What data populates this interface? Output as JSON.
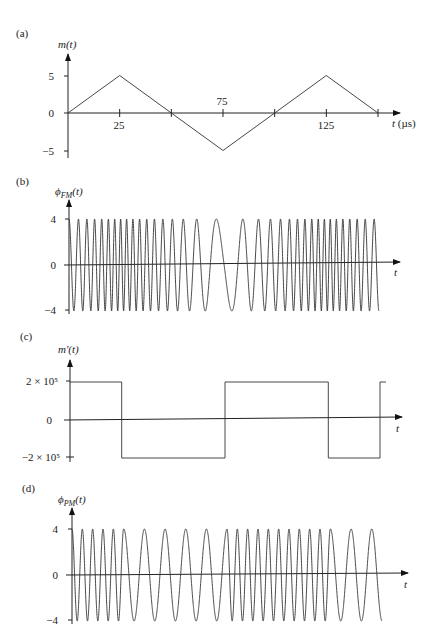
{
  "figure": {
    "panels": [
      {
        "id": "a",
        "label": "(a)",
        "ylabel": "m(t)",
        "xlabel": "t (µs)",
        "yticks": [
          "5",
          "0",
          "−5"
        ],
        "xticks": [
          "25",
          "75",
          "125"
        ]
      },
      {
        "id": "b",
        "label": "(b)",
        "ylabel": "ϕFM(t)",
        "xlabel": "t",
        "yticks": [
          "4",
          "0",
          "−4"
        ]
      },
      {
        "id": "c",
        "label": "(c)",
        "ylabel": "m′(t)",
        "xlabel": "t",
        "yticks": [
          "2 × 10⁵",
          "0",
          "−2 × 10⁵"
        ]
      },
      {
        "id": "d",
        "label": "(d)",
        "ylabel": "ϕPM(t)",
        "xlabel": "t",
        "yticks": [
          "4",
          "0",
          "−4"
        ]
      }
    ]
  },
  "chart_data": [
    {
      "type": "line",
      "title": "(a) m(t)",
      "xlabel": "t (µs)",
      "ylabel": "m(t)",
      "x": [
        0,
        25,
        50,
        75,
        100,
        125,
        150
      ],
      "values": [
        0,
        5,
        0,
        -5,
        0,
        5,
        0
      ],
      "xticks": [
        25,
        50,
        75,
        100,
        125,
        150
      ],
      "xtick_labels": [
        "25",
        "",
        "75",
        "",
        "125",
        ""
      ],
      "yticks": [
        5,
        0,
        -5
      ],
      "ylim": [
        -5,
        5
      ],
      "xlim": [
        0,
        150
      ],
      "grid": false
    },
    {
      "type": "line",
      "title": "(b) ϕFM(t)",
      "xlabel": "t",
      "ylabel": "ϕFM(t)",
      "description": "FM wave of amplitude 4; instantaneous frequency proportional to m(t): highest at t=25,125 and lowest at t=75",
      "amplitude": 4,
      "yticks": [
        4,
        0,
        -4
      ],
      "ylim": [
        -4,
        4
      ],
      "xlim": [
        0,
        150
      ],
      "grid": false
    },
    {
      "type": "line",
      "title": "(c) m′(t)",
      "xlabel": "t",
      "ylabel": "m′(t)",
      "x": [
        0,
        25,
        25,
        75,
        75,
        125,
        125,
        150,
        150
      ],
      "values": [
        200000,
        200000,
        -200000,
        -200000,
        200000,
        200000,
        -200000,
        -200000,
        200000
      ],
      "yticks": [
        200000,
        0,
        -200000
      ],
      "ylim": [
        -200000,
        200000
      ],
      "xlim": [
        0,
        150
      ],
      "grid": false
    },
    {
      "type": "line",
      "title": "(d) ϕPM(t)",
      "xlabel": "t",
      "ylabel": "ϕPM(t)",
      "description": "PM wave of amplitude 4; high frequency when m′(t)>0 (0–25, 75–125), low frequency when m′(t)<0 (25–75, 125–150)",
      "amplitude": 4,
      "yticks": [
        4,
        0,
        -4
      ],
      "ylim": [
        -4,
        4
      ],
      "xlim": [
        0,
        150
      ],
      "grid": false
    }
  ]
}
